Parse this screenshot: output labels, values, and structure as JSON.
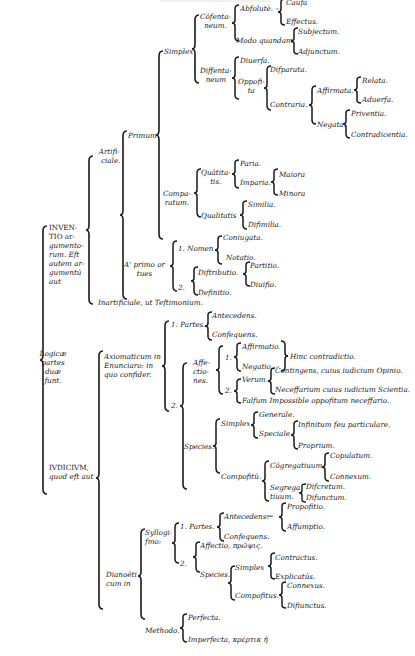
{
  "diagram": {
    "root": "Logicæ partes duæ sunt.",
    "nodes": {
      "root": "Logicæ partes duæ funt.",
      "inventio": "INVENTIO argumentorum. Eft autem argumentū aut",
      "inventio_l1": "INVEN-",
      "inventio_l2": "TIO ar-",
      "inventio_l3": "gumento-",
      "inventio_l4": "rum. Eft",
      "inventio_l5": "autem ar-",
      "inventio_l6": "gumentū",
      "inventio_l7": "aut",
      "iudicium_l1": "IVDICIVM,",
      "iudicium_l2": "quod eft aut",
      "root_l1": "Logicæ",
      "root_l2": "partes",
      "root_l3": "duæ",
      "root_l4": "funt.",
      "artificiale_l1": "Artifi-",
      "artificiale_l2": "ciale.",
      "inartificiale": "Inartificiale, ut Teftimonium.",
      "primum": "Primum",
      "aprimo_l1": "A' primo or",
      "aprimo_l2": "tues",
      "simplex": "Simplex",
      "comparatum_l1": "Compa-",
      "comparatum_l2": "ratum.",
      "cosentaneum_l1": "Cōfenta-",
      "cosentaneum_l2": "neum.",
      "dissentaneum_l1": "Diffenta-",
      "dissentaneum_l2": "neum",
      "absolute": "Abfolutè. –",
      "causa": "Caufa",
      "effectus": "Effectus.",
      "modo_quandam": "Modo quandam.",
      "subjectum": "Subjectum.",
      "adjunctum": "Adjunctum.",
      "diuersa": "Diuerfa.",
      "opposita_l1": "Oppofi-",
      "opposita_l2": "ta",
      "disparata": "Difparata.",
      "contraria": "Contraria.",
      "affirmata": "Affirmata.",
      "relata": "Relata.",
      "aduersa": "Aduerfa.",
      "negata": "Negata.",
      "priventia": "Priventia.",
      "contradicentia": "Contradicentia.",
      "quantitatis_l1": "Quātita-",
      "quantitatis_l2": "tis.",
      "paria": "Paria.",
      "imparia": "Imparia.",
      "maiora": "Maiora",
      "minora": "Minora",
      "qualitatis": "Qualitatis",
      "similia": "Similia.",
      "dissimilia": "Difimilia.",
      "nomen": "1. Nomen",
      "coniugata": "Coniugata.",
      "notatio": "Notatio.",
      "two_a": "2.",
      "distributio": "Diftributio.",
      "partitio": "Partitio.",
      "diuisio": "Diuifio.",
      "definitio": "Definitio.",
      "axiomaticum_l1": "Axiomaticum in",
      "axiomaticum_l2": "Enunciaro: in",
      "axiomaticum_l3": "quo confider.",
      "partes1": "1. Partes.",
      "antecedens1": "Antecedens.",
      "consequens1": "Confequens.",
      "two_b": "2.",
      "affectiones_l1": "Affe-",
      "affectiones_l2": "ctio-",
      "affectiones_l3": "nes.",
      "one_c": "1.",
      "affirmatio": "Affirmatio.",
      "negatio": "Negatio. –",
      "hinc": "Hinc contradictio.",
      "two_c": "2.",
      "verum": "Verum.",
      "contingens": "Contingens, cuius iudicium Opinio.",
      "necessarium": "Neceffarium cuius iudicium Scientia.",
      "falsum": "Falfum Impossible oppofitum neceffario.",
      "species1": "Species.",
      "simplex2": "Simplex",
      "generale": "Generale.",
      "speciale": "Speciale.",
      "infinitum": "Infinitum feu particulare.",
      "proprium": "Proprium.",
      "compositu": "Compofitū.",
      "congregatiuum": "Cōgregatiuum.",
      "copulatum": "Copulatum.",
      "connexum": "Connexum.",
      "segregatiuum_l1": "Segrega",
      "segregatiuum_l2": "tiuum.",
      "discretum": "Difcretum.",
      "disiunctum": "Difunctum.",
      "dianoeticum_l1": "Dianoēti",
      "dianoeticum_l2": "cum in",
      "syllogismo_l1": "Syllogi-",
      "syllogismo_l2": "fmo:",
      "partes2": "1. Partes.",
      "antecedens2": "Antecedens.",
      "dash": "—",
      "propositio": "Propofitio.",
      "assumptio": "Affumptio.",
      "consequens2": "Confequens.",
      "two_d": "2.",
      "affectio": "Affectio, πρῶψις.",
      "species2": "Species.",
      "simplex3": "Simplex",
      "contractus": "Contractus.",
      "explicatus": "Explicatūs.",
      "compositus": "Compofitus.",
      "connexus": "Connexus.",
      "disiunctus": "Difiunctus.",
      "methodo": "Methodo.",
      "perfecta": "Perfecta.",
      "imperfecta": "Imperfecta, κρέρτικ  ῆ"
    }
  },
  "colors": {
    "ink": "#1a1a1a",
    "paper": "#ffffff"
  }
}
